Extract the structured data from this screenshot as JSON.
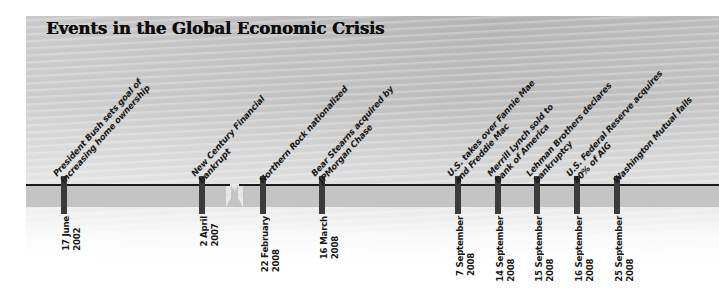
{
  "title": "Events in the Global Economic Crisis",
  "axis": {
    "break_label": "timeline-break",
    "band_color": "#c4c4c4",
    "line_color": "#1a1a1a",
    "tick_color": "#3b3b3b"
  },
  "events": [
    {
      "x": 64,
      "label_lines": [
        "President Bush sets goal of",
        "increasing home ownership"
      ],
      "date_day": "17 June",
      "date_year": "2002"
    },
    {
      "x": 202,
      "label_lines": [
        "New Century Financial",
        "bankrupt"
      ],
      "date_day": "2 April",
      "date_year": "2007"
    },
    {
      "x": 263,
      "label_lines": [
        "Northern Rock nationalized"
      ],
      "date_day": "22 February",
      "date_year": "2008"
    },
    {
      "x": 322,
      "label_lines": [
        "Bear Stearns acquired by",
        "JPMorgan Chase"
      ],
      "date_day": "16 March",
      "date_year": "2008"
    },
    {
      "x": 458,
      "label_lines": [
        "U.S. takes over Fannie Mae",
        "and Freddie Mac"
      ],
      "date_day": "7 September",
      "date_year": "2008"
    },
    {
      "x": 498,
      "label_lines": [
        "Merrill Lynch sold to",
        "Bank of America"
      ],
      "date_day": "14 September",
      "date_year": "2008"
    },
    {
      "x": 537,
      "label_lines": [
        "Lehman Brothers declares",
        "bankruptcy"
      ],
      "date_day": "15 September",
      "date_year": "2008"
    },
    {
      "x": 577,
      "label_lines": [
        "U.S. Federal Reserve acquires",
        "80% of AIG"
      ],
      "date_day": "16 September",
      "date_year": "2008"
    },
    {
      "x": 617,
      "label_lines": [
        "Washington Mutual fails"
      ],
      "date_day": "25 September",
      "date_year": "2008"
    }
  ]
}
